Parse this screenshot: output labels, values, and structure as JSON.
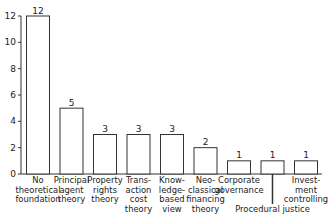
{
  "chart_data": {
    "type": "bar",
    "title": "",
    "xlabel": "",
    "ylabel": "",
    "ylim": [
      0,
      12
    ],
    "yticks": [
      0,
      2,
      4,
      6,
      8,
      10,
      12
    ],
    "grid": false,
    "legend": null,
    "categories": [
      "No theoretical foundation",
      "Principal agent theory",
      "Property rights theory",
      "Transaction cost theory",
      "Knowledge-based view",
      "Neo-classical financing theory",
      "Corporate governance",
      "Procedural justice",
      "Investment controlling"
    ],
    "values": [
      12,
      5,
      3,
      3,
      3,
      2,
      1,
      1,
      1
    ],
    "display_labels": [
      "No\ntheoretical\nfoundation",
      "Principal\nagent\ntheory",
      "Property\nrights\ntheory",
      "Trans-\naction\ncost\ntheory",
      "Know-\nledge-\nbased\nview",
      "Neo-\nclassical\nfinancing\ntheory",
      "Corporate\ngovernance",
      "Procedural justice",
      "Invest-\nment\ncontrolling"
    ],
    "bar_fill": "#ffffff",
    "bar_stroke": "#333333"
  }
}
